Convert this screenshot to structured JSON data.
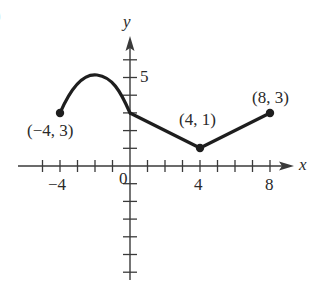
{
  "figure": {
    "corner_mark": ")",
    "x_axis_label": "x",
    "y_axis_label": "y",
    "x_tick_labels": [
      {
        "value": -4,
        "text": "−4"
      },
      {
        "value": 4,
        "text": "4"
      },
      {
        "value": 8,
        "text": "8"
      }
    ],
    "origin_label": "0",
    "y_tick_labels": [
      {
        "value": 5,
        "text": "5"
      }
    ],
    "points": [
      {
        "x": -4,
        "y": 3,
        "label": "(−4, 3)"
      },
      {
        "x": 4,
        "y": 1,
        "label": "(4, 1)"
      },
      {
        "x": 8,
        "y": 3,
        "label": "(8, 3)"
      }
    ],
    "colors": {
      "curve": "#1e1e1e",
      "axis": "#3a3a3a",
      "text": "#2a2a2a"
    }
  },
  "chart_data": {
    "type": "line",
    "title": "",
    "xlabel": "x",
    "ylabel": "y",
    "xlim": [
      -5,
      9
    ],
    "ylim": [
      -6,
      6
    ],
    "grid": false,
    "x_ticks": [
      -5,
      -4,
      -3,
      -2,
      -1,
      0,
      1,
      2,
      3,
      4,
      5,
      6,
      7,
      8
    ],
    "y_ticks": [
      -6,
      -5,
      -4,
      -3,
      -2,
      -1,
      0,
      1,
      2,
      3,
      4,
      5,
      6
    ],
    "series": [
      {
        "name": "curve segment",
        "x": [
          -4,
          -3,
          -2,
          -1,
          0
        ],
        "y": [
          3,
          4.6,
          5.2,
          4.8,
          3
        ],
        "shape": "arc"
      },
      {
        "name": "line segment 1",
        "x": [
          0,
          4
        ],
        "y": [
          3,
          1
        ]
      },
      {
        "name": "line segment 2",
        "x": [
          4,
          8
        ],
        "y": [
          1,
          3
        ]
      }
    ],
    "annotations": [
      "(−4, 3)",
      "(4, 1)",
      "(8, 3)"
    ],
    "marked_points": [
      [
        -4,
        3
      ],
      [
        4,
        1
      ],
      [
        8,
        3
      ]
    ]
  }
}
